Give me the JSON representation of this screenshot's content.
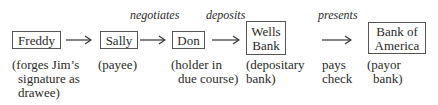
{
  "diagram": {
    "nodes": [
      {
        "id": "freddy",
        "label": "Freddy",
        "note_lines": [
          "(forges Jim’s",
          "signature as",
          "drawee)"
        ]
      },
      {
        "id": "sally",
        "label": "Sally",
        "note_lines": [
          "(payee)"
        ]
      },
      {
        "id": "don",
        "label": "Don",
        "note_lines": [
          "(holder in",
          "due course)"
        ]
      },
      {
        "id": "wells",
        "label_lines": [
          "Wells",
          "Bank"
        ],
        "note_lines": [
          "(depositary",
          "bank)"
        ]
      },
      {
        "id": "boa",
        "label_lines": [
          "Bank of",
          "America"
        ],
        "note_lines": [
          "(payor",
          "bank)"
        ]
      }
    ],
    "edges": [
      {
        "from": "freddy",
        "to": "sally",
        "label": ""
      },
      {
        "from": "sally",
        "to": "don",
        "label": "negotiates"
      },
      {
        "from": "don",
        "to": "wells",
        "label": "deposits"
      },
      {
        "from": "wells",
        "to": "boa",
        "label": "presents"
      }
    ],
    "extra_note_lines": [
      "pays",
      "check"
    ]
  }
}
